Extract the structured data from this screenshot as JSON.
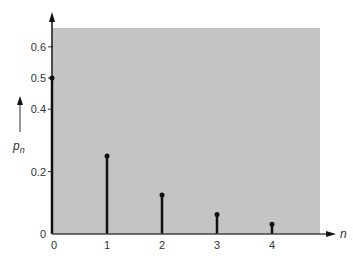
{
  "chart_data": {
    "type": "stem",
    "title": "",
    "xlabel": "n",
    "ylabel": "p_n",
    "x": [
      0,
      1,
      2,
      3,
      4
    ],
    "values": [
      0.5,
      0.25,
      0.125,
      0.0625,
      0.03125
    ],
    "xticks": [
      "0",
      "1",
      "2",
      "3",
      "4"
    ],
    "yticks": [
      "0",
      "0.2",
      "0.4",
      "0.5",
      "0.6"
    ],
    "ytick_values": [
      0,
      0.2,
      0.4,
      0.5,
      0.6
    ],
    "ylim": [
      0,
      0.65
    ],
    "xlim": [
      0,
      4.9
    ],
    "grid": false,
    "legend": null,
    "background_color": "#c4c4c4",
    "stem_color": "#111111"
  },
  "labels": {
    "xlabel": "n",
    "ylabel_main": "p",
    "ylabel_sub": "n",
    "origin_y": "0",
    "origin_x": "0"
  }
}
